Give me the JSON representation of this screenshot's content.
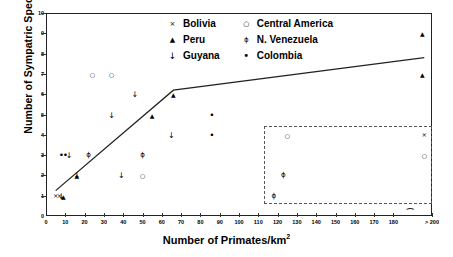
{
  "chart_data": {
    "type": "scatter",
    "title": "",
    "xlabel": "Number of Primates/km",
    "xlabel_sup": "2",
    "ylabel": "Number of Sympatric Species",
    "xlim": [
      0,
      200
    ],
    "ylim": [
      0,
      10
    ],
    "xticks": [
      "0",
      "10",
      "20",
      "30",
      "40",
      "50",
      "60",
      "70",
      "80",
      "90",
      "100",
      "110",
      "120",
      "130",
      "140",
      "150",
      "160",
      "170",
      "180",
      "> 200"
    ],
    "xtick_values": [
      0,
      10,
      20,
      30,
      40,
      50,
      60,
      70,
      80,
      90,
      100,
      110,
      120,
      130,
      140,
      150,
      160,
      170,
      180,
      200
    ],
    "yticks": [
      "0",
      "1",
      "2",
      "3",
      "4",
      "5",
      "6",
      "7",
      "8",
      "9",
      "10"
    ],
    "ytick_values": [
      0,
      1,
      2,
      3,
      4,
      5,
      6,
      7,
      8,
      9,
      10
    ],
    "grid": false,
    "legend_position": "top-center",
    "series": [
      {
        "name": "Bolivia",
        "marker": "x",
        "glyph": "×",
        "points": [
          [
            5,
            1
          ],
          [
            7,
            1
          ],
          [
            196,
            4
          ]
        ]
      },
      {
        "name": "Peru",
        "marker": "triangle",
        "glyph": "▲",
        "points": [
          [
            9,
            1
          ],
          [
            16,
            2
          ],
          [
            55,
            5
          ],
          [
            66,
            6
          ],
          [
            195,
            9
          ],
          [
            195,
            7
          ]
        ]
      },
      {
        "name": "Guyana",
        "marker": "arrow-down",
        "glyph": "↓",
        "points": [
          [
            8,
            1
          ],
          [
            12,
            3
          ],
          [
            16,
            2
          ],
          [
            34,
            5
          ],
          [
            39,
            2
          ],
          [
            65,
            4
          ],
          [
            46,
            6
          ]
        ]
      },
      {
        "name": "Central America",
        "marker": "circle-open",
        "glyph": "○",
        "points": [
          [
            50,
            2
          ],
          [
            24,
            7
          ],
          [
            34,
            7
          ],
          [
            125,
            4
          ],
          [
            196,
            3
          ]
        ]
      },
      {
        "name": "N. Venezuela",
        "marker": "phi",
        "glyph": "ϕ",
        "points": [
          [
            50,
            3
          ],
          [
            22,
            3
          ],
          [
            123,
            2
          ],
          [
            118,
            1
          ]
        ]
      },
      {
        "name": "Colombia",
        "marker": "dot",
        "glyph": "•",
        "points": [
          [
            86,
            5
          ],
          [
            86,
            4
          ],
          [
            8,
            3
          ],
          [
            10,
            3
          ]
        ]
      }
    ],
    "trend_line": {
      "type": "piecewise-linear",
      "points": [
        [
          5,
          1.25
        ],
        [
          66,
          6.2
        ],
        [
          196,
          7.8
        ]
      ]
    },
    "inset_box": {
      "label": "",
      "x_range": [
        113,
        200
      ],
      "y_range": [
        0.6,
        4.45
      ]
    }
  },
  "legend": {
    "columns": [
      {
        "items": [
          {
            "label": "Bolivia",
            "glyph": "×",
            "cls": "b"
          },
          {
            "label": "Peru",
            "glyph": "▲",
            "cls": "p"
          },
          {
            "label": "Guyana",
            "glyph": "↓",
            "cls": "g"
          }
        ]
      },
      {
        "items": [
          {
            "label": "Central America",
            "glyph": "○",
            "cls": "o"
          },
          {
            "label": "N. Venezuela",
            "glyph": "ϕ",
            "cls": "v"
          },
          {
            "label": "Colombia",
            "glyph": "•",
            "cls": "c"
          }
        ]
      }
    ]
  },
  "colors": {
    "axis": "#222222",
    "marker": "#000000",
    "inset_border": "#555555",
    "background": "#ffffff"
  }
}
